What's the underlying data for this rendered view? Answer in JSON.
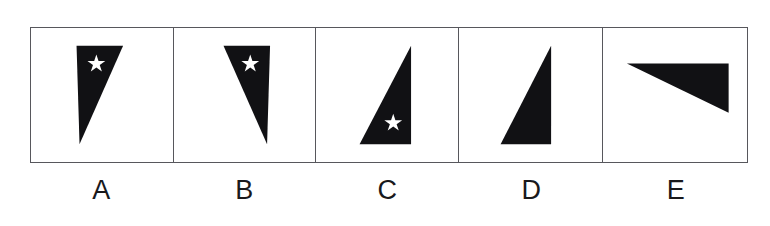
{
  "figure": {
    "panel_count": 5,
    "frame_color": "#57575c",
    "shape_fill": "#111114",
    "star_fill": "#ffffff",
    "background": "#ffffff"
  },
  "panels": [
    {
      "id": "a",
      "label": "A",
      "shape": "right-triangle",
      "orientation": "vertical-left-edge-apex-bottom-left",
      "has_star": true,
      "star_position": "upper",
      "polygon": "46,18 93,18 49,118",
      "star_center_x": 66,
      "star_center_y": 36,
      "star_radius": 9
    },
    {
      "id": "b",
      "label": "B",
      "shape": "right-triangle",
      "orientation": "vertical-right-edge-apex-bottom-right",
      "has_star": true,
      "star_position": "upper",
      "polygon": "50,18 97,18 94,118",
      "star_center_x": 77,
      "star_center_y": 36,
      "star_radius": 9
    },
    {
      "id": "c",
      "label": "C",
      "shape": "right-triangle",
      "orientation": "vertical-right-edge-apex-top-right",
      "has_star": true,
      "star_position": "lower",
      "polygon": "96,18 96,118 44,118",
      "star_center_x": 78,
      "star_center_y": 96,
      "star_radius": 9
    },
    {
      "id": "d",
      "label": "D",
      "shape": "right-triangle",
      "orientation": "vertical-right-edge-apex-top-right",
      "has_star": false,
      "star_position": "none",
      "polygon": "93,18 93,118 42,118",
      "star_center_x": 0,
      "star_center_y": 0,
      "star_radius": 0
    },
    {
      "id": "e",
      "label": "E",
      "shape": "right-triangle",
      "orientation": "horizontal-top-edge-apex-bottom-right-rotated",
      "has_star": false,
      "star_position": "none",
      "polygon": "24,36 126,36 126,86",
      "star_center_x": 0,
      "star_center_y": 0,
      "star_radius": 0
    }
  ]
}
